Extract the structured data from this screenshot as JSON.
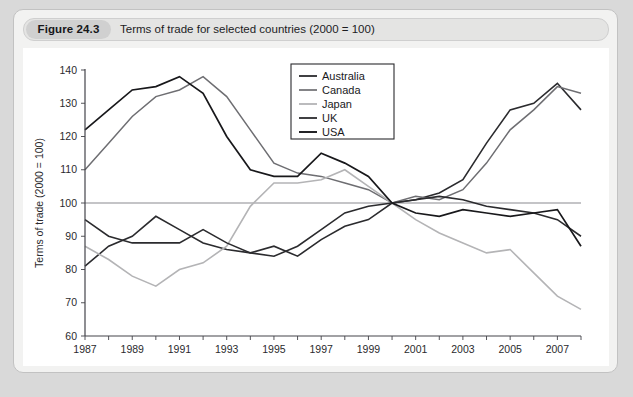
{
  "figure": {
    "badge": "Figure 24.3",
    "caption": "Terms of trade for selected countries (2000 = 100)"
  },
  "chart_data": {
    "type": "line",
    "title": "Terms of trade for selected countries (2000 = 100)",
    "xlabel": "",
    "ylabel": "Terms of trade (2000 = 100)",
    "xlim": [
      1987,
      2008
    ],
    "ylim": [
      60,
      140
    ],
    "ytick_step": 10,
    "xtick_step": 2,
    "grid": false,
    "reference_line": 100,
    "legend_position": "top-right",
    "x": [
      1987,
      1988,
      1989,
      1990,
      1991,
      1992,
      1993,
      1994,
      1995,
      1996,
      1997,
      1998,
      1999,
      2000,
      2001,
      2002,
      2003,
      2004,
      2005,
      2006,
      2007,
      2008
    ],
    "xticks": [
      1987,
      1989,
      1991,
      1993,
      1995,
      1997,
      1999,
      2001,
      2003,
      2005,
      2007
    ],
    "yticks": [
      60,
      70,
      80,
      90,
      100,
      110,
      120,
      130,
      140
    ],
    "series": [
      {
        "name": "Australia",
        "color": "#2b2b2e",
        "width": 1.6,
        "values": [
          81,
          87,
          90,
          96,
          92,
          88,
          86,
          85,
          87,
          84,
          89,
          93,
          95,
          100,
          101,
          103,
          107,
          118,
          128,
          130,
          136,
          128
        ]
      },
      {
        "name": "Canada",
        "color": "#6e6e72",
        "width": 1.5,
        "values": [
          110,
          118,
          126,
          132,
          134,
          138,
          132,
          122,
          112,
          109,
          108,
          106,
          104,
          100,
          102,
          101,
          104,
          112,
          122,
          128,
          135,
          133
        ]
      },
      {
        "name": "Japan",
        "color": "#b4b4b6",
        "width": 1.6,
        "values": [
          87,
          83,
          78,
          75,
          80,
          82,
          87,
          99,
          106,
          106,
          107,
          110,
          105,
          100,
          95,
          91,
          88,
          85,
          86,
          79,
          72,
          68
        ]
      },
      {
        "name": "UK",
        "color": "#2b2b2e",
        "width": 1.6,
        "values": [
          95,
          90,
          88,
          88,
          88,
          92,
          88,
          85,
          84,
          87,
          92,
          97,
          99,
          100,
          101,
          102,
          101,
          99,
          98,
          97,
          95,
          90
        ]
      },
      {
        "name": "USA",
        "color": "#18181b",
        "width": 1.7,
        "values": [
          122,
          128,
          134,
          135,
          138,
          133,
          120,
          110,
          108,
          108,
          115,
          112,
          108,
          100,
          97,
          96,
          98,
          97,
          96,
          97,
          98,
          87
        ]
      }
    ]
  }
}
